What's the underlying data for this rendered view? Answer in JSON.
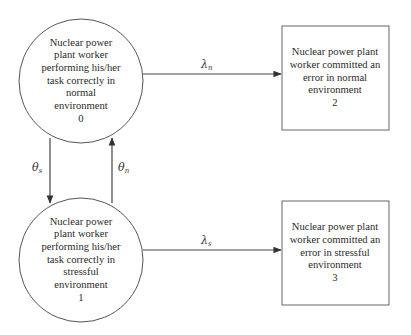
{
  "diagram": {
    "type": "state-transition-diagram",
    "states": [
      {
        "id": 0,
        "shape": "circle",
        "lines": [
          "Nuclear power",
          "plant worker",
          "performing his/her",
          "task correctly in",
          "normal",
          "environment"
        ],
        "number": "0"
      },
      {
        "id": 1,
        "shape": "circle",
        "lines": [
          "Nuclear power",
          "plant worker",
          "performing his/her",
          "task correctly in",
          "stressful",
          "environment"
        ],
        "number": "1"
      },
      {
        "id": 2,
        "shape": "box",
        "lines": [
          "Nuclear power plant",
          "worker committed an",
          "error in normal",
          "environment"
        ],
        "number": "2"
      },
      {
        "id": 3,
        "shape": "box",
        "lines": [
          "Nuclear power plant",
          "worker committed an",
          "error in stressful",
          "environment"
        ],
        "number": "3"
      }
    ],
    "transitions": [
      {
        "from": 0,
        "to": 2,
        "symbol": "λ",
        "subscript": "n"
      },
      {
        "from": 1,
        "to": 3,
        "symbol": "λ",
        "subscript": "s"
      },
      {
        "from": 0,
        "to": 1,
        "symbol": "θ",
        "subscript": "s"
      },
      {
        "from": 1,
        "to": 0,
        "symbol": "θ",
        "subscript": "n"
      }
    ],
    "colors": {
      "stroke": "#555555",
      "text": "#2a2a2a",
      "background": "#ffffff"
    }
  }
}
